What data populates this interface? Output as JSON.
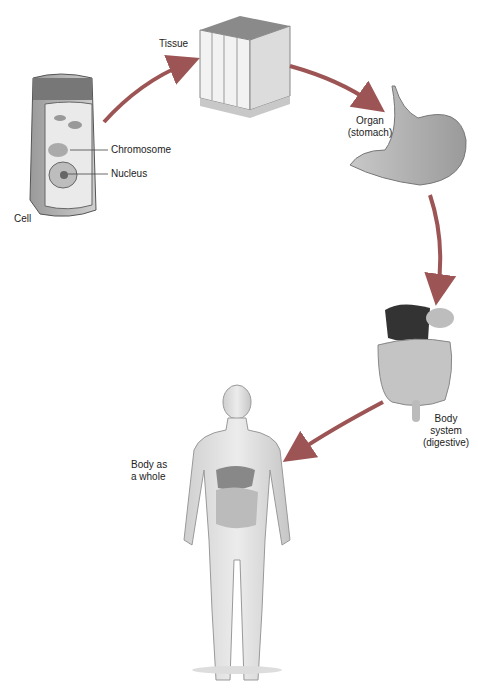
{
  "diagram": {
    "type": "levels-of-organization",
    "stages": [
      {
        "id": "cell",
        "label": "Cell"
      },
      {
        "id": "tissue",
        "label": "Tissue"
      },
      {
        "id": "organ",
        "label": "Organ",
        "sublabel": "(stomach)"
      },
      {
        "id": "system",
        "label": "Body",
        "sublabel": "system",
        "sublabel2": "(digestive)"
      },
      {
        "id": "body",
        "label": "Body as",
        "sublabel": "a whole"
      }
    ],
    "cell_callouts": [
      "Chromosome",
      "Nucleus"
    ],
    "flow": [
      "cell",
      "tissue",
      "organ",
      "system",
      "body"
    ],
    "colors": {
      "arrow": "#a05a5a",
      "tissue_top": "#8a8a8a",
      "organ": "#b0b0b0",
      "liver": "#3a3a3a",
      "skin": "#d8d8d8"
    }
  }
}
